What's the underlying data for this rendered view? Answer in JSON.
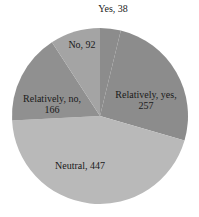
{
  "chart_data": {
    "type": "pie",
    "title": "",
    "start_angle_deg": 0,
    "direction": "clockwise",
    "total": 1000,
    "slices": [
      {
        "label": "Yes",
        "value": 38,
        "color": "#8c8c8c",
        "display": "Yes, 38"
      },
      {
        "label": "Relatively, yes",
        "value": 257,
        "color": "#8c8c8c",
        "display_line1": "Relatively, yes,",
        "display_line2": "257"
      },
      {
        "label": "Neutral",
        "value": 447,
        "color": "#b9b9b9",
        "display": "Neutral, 447"
      },
      {
        "label": "Relatively, no",
        "value": 166,
        "color": "#909090",
        "display_line1": "Relatively, no,",
        "display_line2": "166"
      },
      {
        "label": "No",
        "value": 92,
        "color": "#a4a4a4",
        "display": "No, 92"
      }
    ]
  }
}
